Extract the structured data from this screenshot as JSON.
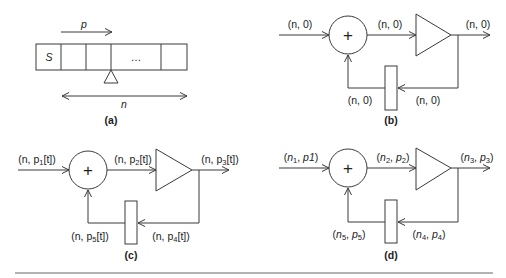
{
  "figure": {
    "panel_a": {
      "caption": "(a)",
      "tape_first_cell": "S",
      "ellipsis": "…",
      "pointer_label": "p",
      "length_label": "n"
    },
    "panel_b": {
      "caption": "(b)",
      "adder_symbol": "+",
      "input_label": "(n, 0)",
      "adder_out_label": "(n, 0)",
      "output_label": "(n, 0)",
      "feedback_in_label": "(n, 0)",
      "feedback_out_label": "(n, 0)"
    },
    "panel_c": {
      "caption": "(c)",
      "adder_symbol": "+",
      "input_label": {
        "pre": "(n, p",
        "sub": "1",
        "post": "[t])"
      },
      "adder_out_label": {
        "pre": "(n, p",
        "sub": "2",
        "post": "[t])"
      },
      "output_label": {
        "pre": "(n, p",
        "sub": "3",
        "post": "[t])"
      },
      "feedback_in_label": {
        "pre": "(n, p",
        "sub": "4",
        "post": "[t])"
      },
      "feedback_out_label": {
        "pre": "(n, p",
        "sub": "5",
        "post": "[t])"
      }
    },
    "panel_d": {
      "caption": "(d)",
      "adder_symbol": "+",
      "input_label": {
        "n_sub": "1",
        "p": "p1",
        "p_sub": ""
      },
      "adder_out_label": {
        "n_sub": "2",
        "p": "p",
        "p_sub": "2"
      },
      "output_label": {
        "n_sub": "3",
        "p": "p",
        "p_sub": "3"
      },
      "feedback_in_label": {
        "n_sub": "4",
        "p": "p",
        "p_sub": "4"
      },
      "feedback_out_label": {
        "n_sub": "5",
        "p": "p",
        "p_sub": "5"
      }
    }
  },
  "colors": {
    "stroke": "#3a3a3a",
    "text": "#222222",
    "rule": "#9a9a9a",
    "background": "#ffffff"
  }
}
